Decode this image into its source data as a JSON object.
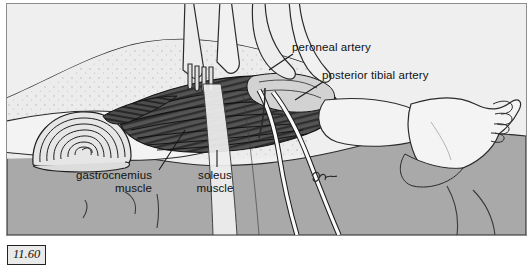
{
  "figure": {
    "number": "11.60",
    "kind": "anatomical-surgical-illustration",
    "palette": {
      "background": "#efefef",
      "drape_light": "#e9e9e9",
      "drape_grey": "#a8a8a8",
      "skin": "#f2f2f2",
      "muscle_dark": "#4a4a4a",
      "vessel_white": "#fbfbfb",
      "ink": "#1a1a1a",
      "frame": "#8d8d8d"
    },
    "labels": [
      {
        "id": "peroneal-artery",
        "text": "peroneal artery",
        "align": "left",
        "x": 291,
        "y": 43
      },
      {
        "id": "posterior-tibial-artery",
        "text": "posterior tibial artery",
        "align": "left",
        "x": 321,
        "y": 71
      },
      {
        "id": "gastrocnemius-muscle",
        "line1": "gastrocnemius",
        "line2": "muscle",
        "align": "right",
        "x": 62,
        "y": 171
      },
      {
        "id": "soleus-muscle",
        "line1": "soleus",
        "line2": "muscle",
        "align": "center",
        "x": 210,
        "y": 171
      }
    ],
    "artist_mark": {
      "id": "artist-signature",
      "x": 316,
      "y": 176
    }
  }
}
